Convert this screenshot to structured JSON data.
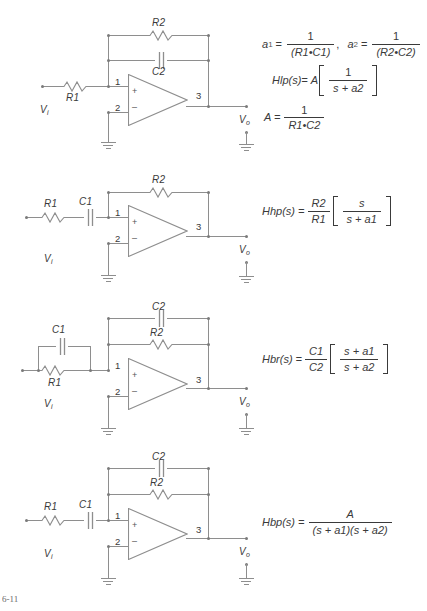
{
  "figure": {
    "caption_partial": "6-11",
    "line_color": "#8e8e8e",
    "text_color": "#3a3a3a"
  },
  "common_labels": {
    "vin": "V",
    "vin_sub": "i",
    "vout": "V",
    "vout_sub": "o",
    "pin_plus": "1",
    "pin_minus": "2",
    "pin_out": "3",
    "plus_sign": "+",
    "minus_sign": "–",
    "ground_icon": "ground-icon",
    "opamp_icon": "opamp-triangle-icon",
    "resistor_icon": "resistor-zigzag-icon",
    "capacitor_icon": "capacitor-plates-icon"
  },
  "circuits": [
    {
      "id": "lowpass",
      "name": "low-pass-filter",
      "input_series": [
        "R1"
      ],
      "feedback_branches": [
        "R2",
        "C2"
      ],
      "labels": {
        "r1": "R1",
        "r2": "R2",
        "c2": "C2"
      }
    },
    {
      "id": "highpass",
      "name": "high-pass-filter",
      "input_series": [
        "R1",
        "C1"
      ],
      "feedback_branches": [
        "R2"
      ],
      "labels": {
        "r1": "R1",
        "c1": "C1",
        "r2": "R2"
      }
    },
    {
      "id": "bandreject",
      "name": "band-reject-filter",
      "input_parallel": [
        "R1",
        "C1"
      ],
      "feedback_branches": [
        "C2",
        "R2"
      ],
      "labels": {
        "r1": "R1",
        "c1": "C1",
        "r2": "R2",
        "c2": "C2"
      }
    },
    {
      "id": "bandpass",
      "name": "band-pass-filter",
      "input_series": [
        "R1",
        "C1"
      ],
      "feedback_branches": [
        "C2",
        "R2"
      ],
      "labels": {
        "r1": "R1",
        "c1": "C1",
        "r2": "R2",
        "c2": "C2"
      }
    }
  ],
  "formulas": {
    "lowpass": {
      "a1_lhs": "a",
      "a1_sub": "1",
      "a1_eq": "=",
      "a1_num": "1",
      "a1_den": "(R1•C1)",
      "a1_trail": ",",
      "a2_lhs": "a",
      "a2_sub": "2",
      "a2_eq": "=",
      "a2_num": "1",
      "a2_den": "(R2•C2)",
      "h_lhs": "Hlp(s)=",
      "h_gain": "A",
      "h_num": "1",
      "h_den": "s + a2",
      "A_lhs": "A =",
      "A_num": "1",
      "A_den": "R1•C2"
    },
    "highpass": {
      "h_lhs": "Hhp(s) =",
      "pre_num": "R2",
      "pre_den": "R1",
      "h_num": "s",
      "h_den": "s + a1"
    },
    "bandreject": {
      "h_lhs": "Hbr(s) =",
      "pre_num": "C1",
      "pre_den": "C2",
      "h_num": "s + a1",
      "h_den": "s + a2"
    },
    "bandpass": {
      "h_lhs": "Hbp(s) =",
      "h_num": "A",
      "h_den": "(s + a1)(s + a2)"
    }
  }
}
